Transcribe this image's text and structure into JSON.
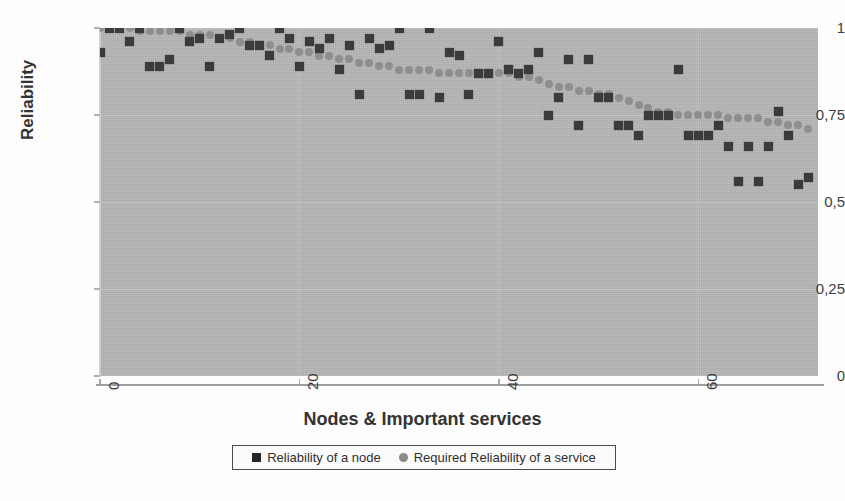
{
  "chart_data": {
    "type": "scatter",
    "title": "",
    "xlabel": "Nodes & Important services",
    "ylabel": "Reliability",
    "xlim": [
      0,
      72
    ],
    "ylim": [
      0,
      1
    ],
    "grid": true,
    "legend_position": "bottom",
    "x_ticks": [
      "0",
      "20",
      "40",
      "60"
    ],
    "x_tick_values": [
      0,
      20,
      40,
      60
    ],
    "y_ticks": [
      "0",
      "0,25",
      "0,5",
      "0,75",
      "1"
    ],
    "y_tick_values": [
      0,
      0.25,
      0.5,
      0.75,
      1
    ],
    "series": [
      {
        "name": "Reliability of a node",
        "marker": "square",
        "color": "#3b3b3b",
        "x": [
          0,
          1,
          2,
          3,
          4,
          5,
          6,
          7,
          8,
          9,
          10,
          11,
          12,
          13,
          14,
          15,
          16,
          17,
          18,
          19,
          20,
          21,
          22,
          23,
          24,
          25,
          26,
          27,
          28,
          29,
          30,
          31,
          32,
          33,
          34,
          35,
          36,
          37,
          38,
          39,
          40,
          41,
          42,
          43,
          44,
          45,
          46,
          47,
          48,
          49,
          50,
          51,
          52,
          53,
          54,
          55,
          56,
          57,
          58,
          59,
          60,
          61,
          62,
          63,
          64,
          65,
          66,
          67,
          68,
          69,
          70,
          71
        ],
        "values": [
          0.93,
          1.0,
          1.0,
          0.96,
          1.0,
          0.89,
          0.89,
          0.91,
          1.0,
          0.96,
          0.97,
          0.89,
          0.97,
          0.98,
          1.0,
          0.95,
          0.95,
          0.92,
          1.0,
          0.97,
          0.89,
          0.96,
          0.94,
          0.97,
          0.88,
          0.95,
          0.81,
          0.97,
          0.94,
          0.95,
          1.0,
          0.81,
          0.81,
          1.0,
          0.8,
          0.93,
          0.92,
          0.81,
          0.87,
          0.87,
          0.96,
          0.88,
          0.87,
          0.88,
          0.93,
          0.75,
          0.8,
          0.91,
          0.72,
          0.91,
          0.8,
          0.8,
          0.72,
          0.72,
          0.69,
          0.75,
          0.75,
          0.75,
          0.88,
          0.69,
          0.69,
          0.69,
          0.72,
          0.66,
          0.56,
          0.66,
          0.56,
          0.66,
          0.76,
          0.69,
          0.55,
          0.57
        ]
      },
      {
        "name": "Required Reliability of a service",
        "marker": "circle",
        "color": "#8e8e8e",
        "x": [
          0,
          1,
          2,
          3,
          4,
          5,
          6,
          7,
          8,
          9,
          10,
          11,
          12,
          13,
          14,
          15,
          16,
          17,
          18,
          19,
          20,
          21,
          22,
          23,
          24,
          25,
          26,
          27,
          28,
          29,
          30,
          31,
          32,
          33,
          34,
          35,
          36,
          37,
          38,
          39,
          40,
          41,
          42,
          43,
          44,
          45,
          46,
          47,
          48,
          49,
          50,
          51,
          52,
          53,
          54,
          55,
          56,
          57,
          58,
          59,
          60,
          61,
          62,
          63,
          64,
          65,
          66,
          67,
          68,
          69,
          70,
          71
        ],
        "values": [
          1.0,
          1.0,
          1.0,
          1.0,
          0.99,
          0.99,
          0.99,
          0.99,
          0.99,
          0.98,
          0.98,
          0.98,
          0.97,
          0.97,
          0.96,
          0.96,
          0.95,
          0.95,
          0.94,
          0.94,
          0.93,
          0.93,
          0.92,
          0.92,
          0.91,
          0.91,
          0.9,
          0.9,
          0.89,
          0.89,
          0.88,
          0.88,
          0.88,
          0.88,
          0.87,
          0.87,
          0.87,
          0.87,
          0.87,
          0.87,
          0.87,
          0.87,
          0.86,
          0.86,
          0.85,
          0.84,
          0.83,
          0.83,
          0.82,
          0.82,
          0.81,
          0.81,
          0.8,
          0.79,
          0.78,
          0.77,
          0.76,
          0.76,
          0.75,
          0.75,
          0.75,
          0.75,
          0.75,
          0.74,
          0.74,
          0.74,
          0.74,
          0.73,
          0.73,
          0.72,
          0.72,
          0.71
        ]
      }
    ]
  },
  "axes": {
    "y_title": "Reliability",
    "x_title": "Nodes & Important services"
  },
  "legend": {
    "entries": [
      {
        "label": "Reliability of a node",
        "marker": "square-marker-icon"
      },
      {
        "label": "Required Reliability of a service",
        "marker": "circle-marker-icon"
      }
    ]
  },
  "colors": {
    "plot_background": "#b6b6b6",
    "node_marker": "#3b3b3b",
    "service_marker": "#8e8e8e",
    "text": "#333333"
  }
}
